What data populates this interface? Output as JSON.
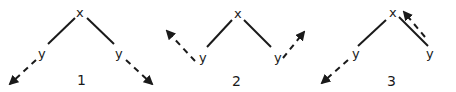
{
  "diagrams": [
    {
      "number": "1",
      "top_label": "x",
      "left_label": "y",
      "right_label": "y",
      "description": "Both y branches extend outward/downward with dashed arrows"
    },
    {
      "number": "2",
      "top_label": "x",
      "left_label": "y",
      "right_label": "y",
      "description": "Both y branches turn upward/outward with dashed arrows"
    },
    {
      "number": "3",
      "top_label": "x",
      "left_label": "y",
      "right_label": "y",
      "description": "Left y continues outward with dashed arrow; right branch has dashed arrow returning back toward x"
    }
  ]
}
